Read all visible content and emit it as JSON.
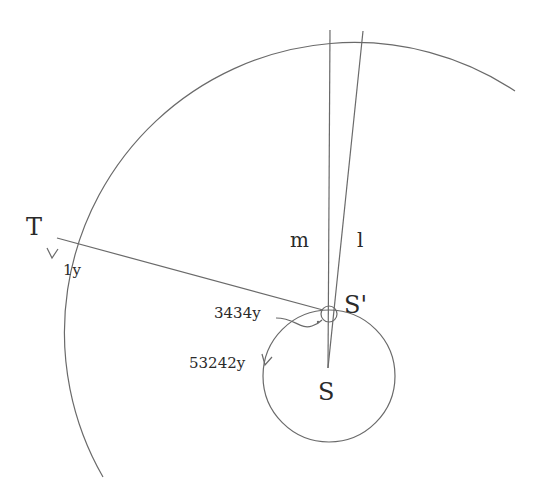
{
  "diagram": {
    "points": {
      "T": "T",
      "S_prime": "S'",
      "S": "S"
    },
    "lines": {
      "m": "m",
      "l": "l"
    },
    "periods": {
      "earth_orbit": "1y",
      "small_loop": "3434y",
      "sun_orbit": "53242y"
    },
    "colors": {
      "stroke": "#6a6a6a",
      "text": "#2a2a2a",
      "background": "#ffffff"
    }
  }
}
